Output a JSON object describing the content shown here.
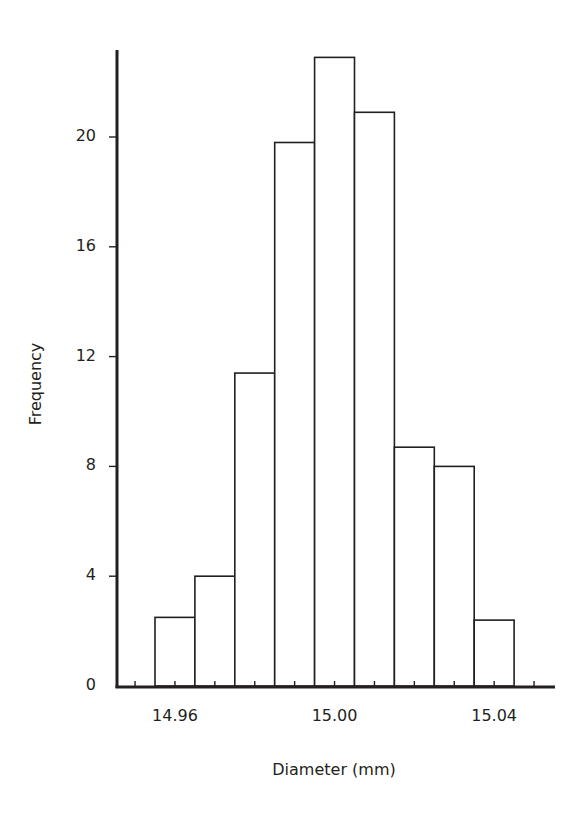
{
  "chart_data": {
    "type": "bar",
    "subtype": "histogram",
    "title": "",
    "xlabel": "Diameter (mm)",
    "ylabel": "Frequency",
    "bin_width": 0.01,
    "bin_edges": [
      14.955,
      14.965,
      14.975,
      14.985,
      14.995,
      15.005,
      15.015,
      15.025,
      15.035,
      15.045
    ],
    "categories": [
      "14.96",
      "14.97",
      "14.98",
      "14.99",
      "15.00",
      "15.01",
      "15.02",
      "15.03",
      "15.04"
    ],
    "values": [
      2.5,
      4,
      11.4,
      19.8,
      22.9,
      20.9,
      8.7,
      8.0,
      2.4
    ],
    "x_ticks": [
      "14.96",
      "15.00",
      "15.04"
    ],
    "y_ticks": [
      "0",
      "4",
      "8",
      "12",
      "16",
      "20"
    ],
    "ylim": [
      0,
      23
    ],
    "grid": false,
    "legend": null,
    "bar_fill": "#ffffff",
    "bar_stroke": "#231f20"
  },
  "axes": {
    "xlabel": "Diameter (mm)",
    "ylabel": "Frequency"
  }
}
